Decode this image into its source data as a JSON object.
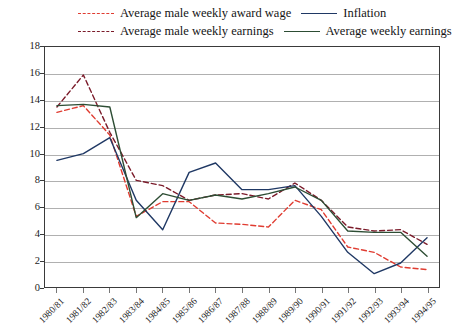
{
  "chart_data": {
    "type": "line",
    "title": "",
    "xlabel": "",
    "ylabel": "",
    "ylim": [
      0,
      18
    ],
    "yticks": [
      0,
      2,
      4,
      6,
      8,
      10,
      12,
      14,
      16,
      18
    ],
    "grid": "horizontal",
    "legend_position": "top",
    "categories": [
      "1980/81",
      "1981/82",
      "1982/83",
      "1983/84",
      "1984/85",
      "1985/86",
      "1986/87",
      "1987/88",
      "1988/89",
      "1989/90",
      "1990/91",
      "1991/92",
      "1992/93",
      "1993/94",
      "1994/95"
    ],
    "series": [
      {
        "name": "Average male weekly award wage",
        "color": "#E03C31",
        "style": "dashed",
        "values": [
          13.1,
          13.6,
          11.4,
          5.3,
          6.4,
          6.4,
          4.8,
          4.7,
          4.5,
          6.5,
          5.8,
          3.0,
          2.6,
          1.5,
          1.3
        ]
      },
      {
        "name": "Average male weekly earnings",
        "color": "#7B1B2A",
        "style": "dashed",
        "values": [
          13.5,
          15.9,
          11.6,
          8.0,
          7.6,
          6.5,
          6.9,
          7.0,
          6.6,
          7.8,
          6.5,
          4.5,
          4.2,
          4.3,
          3.2
        ]
      },
      {
        "name": "Inflation",
        "color": "#1F3864",
        "style": "solid",
        "values": [
          9.5,
          10.0,
          11.2,
          6.5,
          4.3,
          8.6,
          9.3,
          7.3,
          7.3,
          7.6,
          5.3,
          2.6,
          1.0,
          1.8,
          3.7
        ]
      },
      {
        "name": "Average weekly earnings",
        "color": "#2D4D34",
        "style": "solid",
        "values": [
          13.6,
          13.7,
          13.5,
          5.2,
          7.0,
          6.5,
          6.9,
          6.6,
          7.0,
          7.5,
          6.5,
          4.2,
          4.1,
          4.1,
          2.3
        ]
      }
    ]
  },
  "legend": {
    "items": [
      {
        "label": "Average male weekly award wage",
        "color": "#E03C31",
        "style": "dashed"
      },
      {
        "label": "Inflation",
        "color": "#1F3864",
        "style": "solid"
      },
      {
        "label": "Average male weekly earnings",
        "color": "#7B1B2A",
        "style": "dashed"
      },
      {
        "label": "Average weekly earnings",
        "color": "#2D4D34",
        "style": "solid"
      }
    ]
  }
}
